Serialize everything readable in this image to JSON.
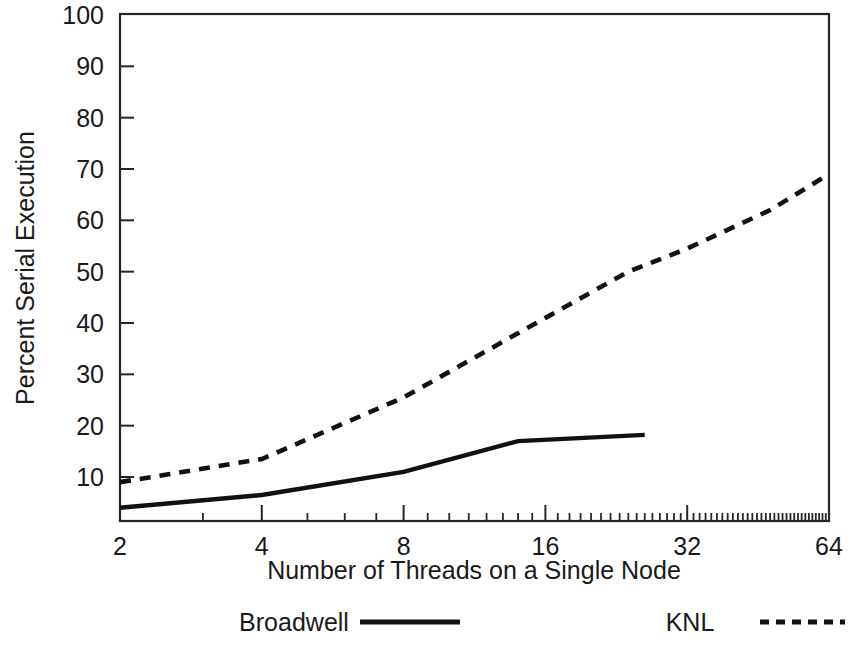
{
  "chart_data": {
    "type": "line",
    "title": "",
    "xlabel": "Number of Threads on a Single Node",
    "ylabel": "Percent Serial Execution",
    "x_scale": "log2",
    "y_scale": "linear",
    "xlim": [
      2,
      64
    ],
    "ylim": [
      0,
      100
    ],
    "grid": false,
    "legend_position": "bottom",
    "x_ticks": [
      2,
      4,
      8,
      16,
      32,
      64
    ],
    "x_tick_labels": [
      "2",
      "4",
      "8",
      "16",
      "32",
      "64"
    ],
    "y_ticks": [
      10,
      20,
      30,
      40,
      50,
      60,
      70,
      80,
      90,
      100
    ],
    "y_tick_labels": [
      "10",
      "20",
      "30",
      "40",
      "50",
      "60",
      "70",
      "80",
      "90",
      "100"
    ],
    "series": [
      {
        "name": "Broadwell",
        "style": "solid",
        "color": "#111111",
        "x": [
          2,
          4,
          8,
          14,
          26
        ],
        "values": [
          4.0,
          6.5,
          11.0,
          17.0,
          18.2
        ]
      },
      {
        "name": "KNL",
        "style": "dashed",
        "color": "#111111",
        "x": [
          2,
          4,
          8,
          16,
          24,
          32,
          48,
          64
        ],
        "values": [
          9.0,
          13.5,
          25.5,
          41.0,
          50.0,
          54.5,
          62.0,
          69.0
        ]
      }
    ]
  },
  "axis": {
    "x_title": "Number of Threads on a Single Node",
    "y_title": "Percent Serial Execution"
  },
  "legend": {
    "entries": [
      {
        "label": "Broadwell",
        "style": "solid"
      },
      {
        "label": "KNL",
        "style": "dashed"
      }
    ]
  }
}
